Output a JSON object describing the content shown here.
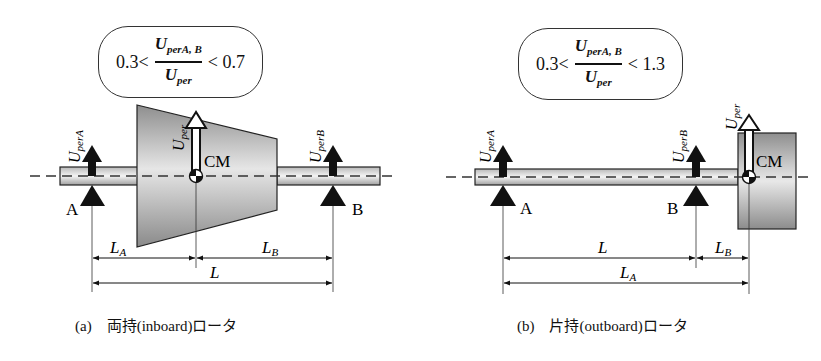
{
  "panels": [
    {
      "id": "a",
      "caption": "(a)　両持(inboard)ロータ",
      "formula": {
        "lower": "0.3<",
        "numerator_main": "U",
        "numerator_sub": "perA, B",
        "denominator_main": "U",
        "denominator_sub": "per",
        "upper": "< 0.7"
      },
      "labels": {
        "bearing_a": "A",
        "bearing_b": "B",
        "center_mass": "CM",
        "force_a": "U",
        "force_a_sub": "perA",
        "force_b": "U",
        "force_b_sub": "perB",
        "force_total": "U",
        "force_total_sub": "per",
        "dim_la": "L",
        "dim_la_sub": "A",
        "dim_lb": "L",
        "dim_lb_sub": "B",
        "dim_l": "L"
      }
    },
    {
      "id": "b",
      "caption": "(b)　片持(outboard)ロータ",
      "formula": {
        "lower": "0.3<",
        "numerator_main": "U",
        "numerator_sub": "perA, B",
        "denominator_main": "U",
        "denominator_sub": "per",
        "upper": "< 1.3"
      },
      "labels": {
        "bearing_a": "A",
        "bearing_b": "B",
        "center_mass": "CM",
        "force_a": "U",
        "force_a_sub": "perA",
        "force_b": "U",
        "force_b_sub": "perB",
        "force_total": "U",
        "force_total_sub": "per",
        "dim_l": "L",
        "dim_lb": "L",
        "dim_lb_sub": "B",
        "dim_la": "L",
        "dim_la_sub": "A"
      }
    }
  ],
  "colors": {
    "stroke": "#222222",
    "shade_light": "#f2f2f2",
    "shade_dark": "#9a9a9a",
    "formula_bg": "#ffffff"
  }
}
